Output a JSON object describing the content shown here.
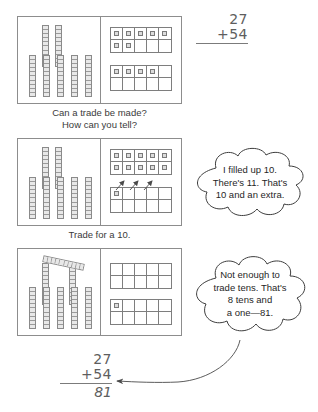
{
  "document": {
    "kind": "math-worksheet-diagram",
    "topic": "Two-digit addition with regrouping using base-ten blocks and ten frames"
  },
  "problem": {
    "addend_top": "27",
    "addend_bottom": "+54",
    "answer": "81"
  },
  "steps": [
    {
      "id": "step-1",
      "caption": "Can a trade be made?\nHow can you tell?",
      "tens_top_row": 2,
      "tens_bottom_row": 5,
      "tens_diagonal": 0,
      "frame_top_filled": 7,
      "frame_bottom_filled": 4,
      "arrows": 0
    },
    {
      "id": "step-2",
      "caption": "Trade for a 10.",
      "tens_top_row": 2,
      "tens_bottom_row": 5,
      "tens_diagonal": 0,
      "frame_top_filled": 10,
      "frame_bottom_filled": 1,
      "arrows": 3
    },
    {
      "id": "step-3",
      "caption": "",
      "tens_top_row": 2,
      "tens_bottom_row": 5,
      "tens_diagonal": 1,
      "frame_top_filled": 0,
      "frame_bottom_filled": 1,
      "arrows": 0
    }
  ],
  "callouts": [
    {
      "id": "callout-trade",
      "text": "I filled up 10.\nThere's 11. That's\n10 and an extra."
    },
    {
      "id": "callout-answer",
      "text": "Not enough to\ntrade tens. That's\n8 tens and\na one—81."
    }
  ],
  "colors": {
    "ink": "#2b2b2b",
    "rule": "#8d8d8d",
    "block_fill": "#e8e8e8",
    "pencil": "#5e5e5e"
  }
}
